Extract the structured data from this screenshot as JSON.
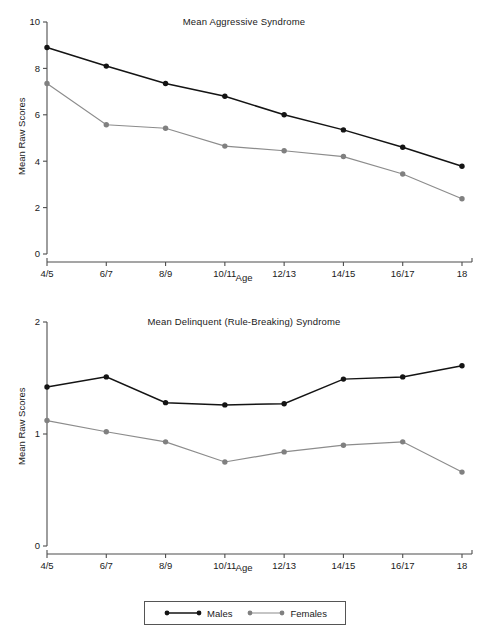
{
  "figure": {
    "legend": {
      "entries": [
        {
          "label": "Males",
          "color": "#141414"
        },
        {
          "label": "Females",
          "color": "#808080"
        }
      ]
    }
  },
  "chart_data": [
    {
      "type": "line",
      "title": "Mean Aggressive Syndrome",
      "xlabel": "Age",
      "ylabel": "Mean Raw Scores",
      "categories": [
        "4/5",
        "6/7",
        "8/9",
        "10/11",
        "12/13",
        "14/15",
        "16/17",
        "18"
      ],
      "ylim": [
        0,
        10
      ],
      "yticks": [
        0,
        2,
        4,
        6,
        8,
        10
      ],
      "grid": false,
      "legend_position": "bottom",
      "series": [
        {
          "name": "Males",
          "color": "#141414",
          "values": [
            8.9,
            8.1,
            7.35,
            6.8,
            6.0,
            5.35,
            4.6,
            3.78
          ]
        },
        {
          "name": "Females",
          "color": "#808080",
          "values": [
            7.35,
            5.57,
            5.42,
            4.65,
            4.45,
            4.2,
            3.45,
            2.38
          ]
        }
      ]
    },
    {
      "type": "line",
      "title": "Mean Delinquent (Rule-Breaking) Syndrome",
      "xlabel": "Age",
      "ylabel": "Mean Raw Scores",
      "categories": [
        "4/5",
        "6/7",
        "8/9",
        "10/11",
        "12/13",
        "14/15",
        "16/17",
        "18"
      ],
      "ylim": [
        0,
        2
      ],
      "yticks": [
        0,
        1,
        2
      ],
      "grid": false,
      "legend_position": "bottom",
      "series": [
        {
          "name": "Males",
          "color": "#141414",
          "values": [
            1.42,
            1.51,
            1.28,
            1.26,
            1.27,
            1.49,
            1.51,
            1.61
          ]
        },
        {
          "name": "Females",
          "color": "#808080",
          "values": [
            1.12,
            1.02,
            0.93,
            0.75,
            0.84,
            0.9,
            0.93,
            0.66
          ]
        }
      ]
    }
  ]
}
